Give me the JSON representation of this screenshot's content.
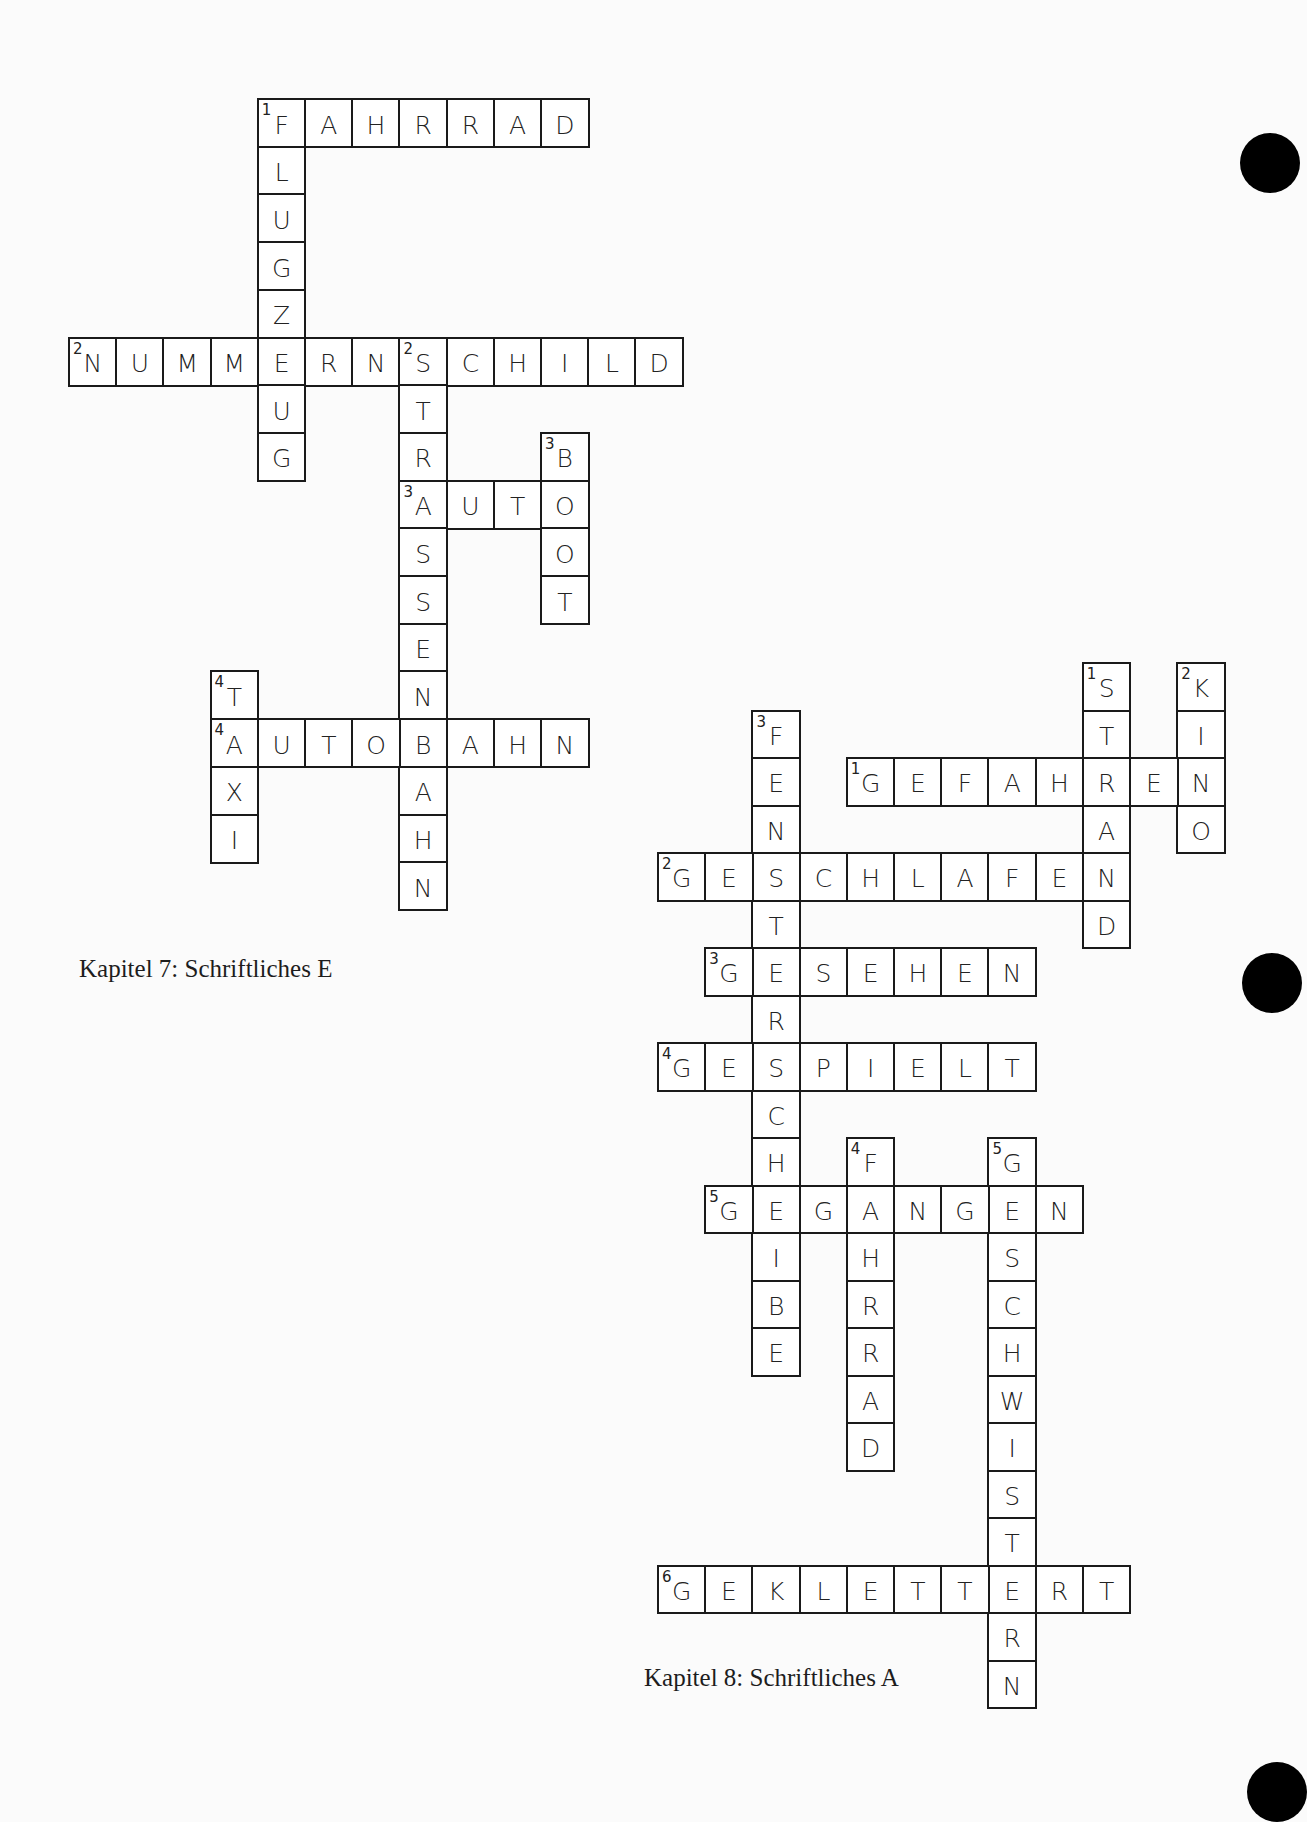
{
  "page": {
    "background": "#fbfbfb",
    "ink": "#1a1a1a"
  },
  "crosswords": [
    {
      "id": "kapitel-7",
      "caption": "Kapitel 7: Schriftliches E",
      "caption_pos": {
        "x": 79,
        "y": 955
      },
      "origin": {
        "x": 68,
        "y": 98
      },
      "cell": {
        "w": 47.2,
        "h": 47.7
      },
      "words": [
        {
          "number": "1",
          "direction": "across",
          "answer": "FAHRRAD",
          "col": 4,
          "row": 0
        },
        {
          "number": "1",
          "direction": "down",
          "answer": "FLUGZEUG",
          "col": 4,
          "row": 0
        },
        {
          "number": "2",
          "direction": "across",
          "answer": "NUMMERNSCHILD",
          "col": 0,
          "row": 5
        },
        {
          "number": "2",
          "direction": "down",
          "answer": "STRASSENBAHN",
          "col": 7,
          "row": 5
        },
        {
          "number": "3",
          "direction": "across",
          "answer": "AUTO",
          "col": 7,
          "row": 8
        },
        {
          "number": "3",
          "direction": "down",
          "answer": "BOOT",
          "col": 10,
          "row": 7
        },
        {
          "number": "4",
          "direction": "across",
          "answer": "AUTOBAHN",
          "col": 3,
          "row": 13
        },
        {
          "number": "4",
          "direction": "down",
          "answer": "TAXI",
          "col": 3,
          "row": 12
        }
      ]
    },
    {
      "id": "kapitel-8",
      "caption": "Kapitel 8: Schriftliches A",
      "caption_pos": {
        "x": 644,
        "y": 1664
      },
      "origin": {
        "x": 657,
        "y": 662
      },
      "cell": {
        "w": 47.2,
        "h": 47.5
      },
      "words": [
        {
          "number": "1",
          "direction": "down",
          "answer": "STRAND",
          "col": 9,
          "row": 0
        },
        {
          "number": "2",
          "direction": "down",
          "answer": "KINO",
          "col": 11,
          "row": 0
        },
        {
          "number": "3",
          "direction": "down",
          "answer": "FENSTERSCHEIBE",
          "col": 2,
          "row": 1
        },
        {
          "number": "1",
          "direction": "across",
          "answer": "GEFAHREN",
          "col": 4,
          "row": 2
        },
        {
          "number": "2",
          "direction": "across",
          "answer": "GESCHLAFEN",
          "col": 0,
          "row": 4
        },
        {
          "number": "3",
          "direction": "across",
          "answer": "GESEHEN",
          "col": 1,
          "row": 6
        },
        {
          "number": "4",
          "direction": "across",
          "answer": "GESPIELT",
          "col": 0,
          "row": 8
        },
        {
          "number": "4",
          "direction": "down",
          "answer": "FAHRRAD",
          "col": 4,
          "row": 10
        },
        {
          "number": "5",
          "direction": "down",
          "answer": "GESCHWISTERN",
          "col": 7,
          "row": 10
        },
        {
          "number": "5",
          "direction": "across",
          "answer": "GEGANGEN",
          "col": 1,
          "row": 11
        },
        {
          "number": "6",
          "direction": "across",
          "answer": "GEKLETTERT",
          "col": 0,
          "row": 19
        }
      ]
    }
  ],
  "binder_holes": [
    {
      "x": 1270,
      "y": 163
    },
    {
      "x": 1272,
      "y": 983
    },
    {
      "x": 1277,
      "y": 1792
    }
  ]
}
